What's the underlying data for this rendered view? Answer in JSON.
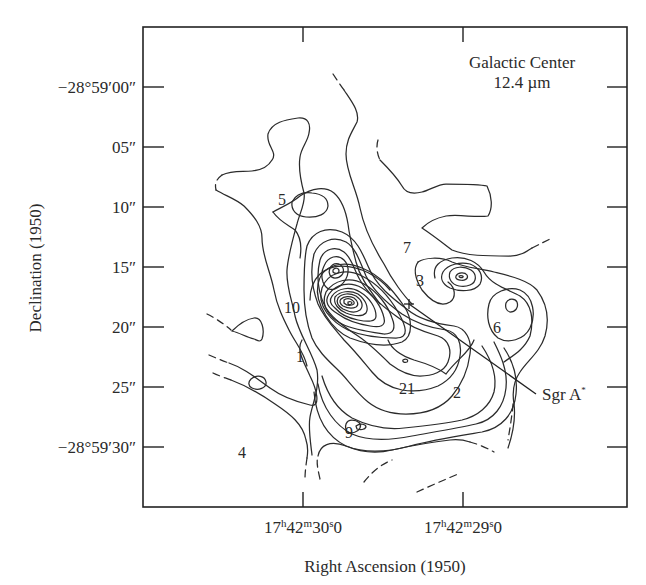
{
  "chart_data": {
    "type": "contour",
    "title": "Galactic Center",
    "subtitle": "12.4 µm",
    "xlabel": "Right Ascension (1950)",
    "ylabel": "Declination (1950)",
    "x_ticks": [
      {
        "label_parts": [
          "17",
          "h",
          "42",
          "m",
          "30",
          "s",
          ".0"
        ],
        "text": "17h42m30s.0",
        "px": 303
      },
      {
        "label_parts": [
          "17",
          "h",
          "42",
          "m",
          "29",
          "s",
          ".0"
        ],
        "text": "17h42m29s.0",
        "px": 463
      }
    ],
    "y_ticks": [
      {
        "label": "−28°59′00″",
        "value_arcsec": 0,
        "px": 87
      },
      {
        "label": "05″",
        "value_arcsec": 5,
        "px": 147
      },
      {
        "label": "10″",
        "value_arcsec": 10,
        "px": 207
      },
      {
        "label": "15″",
        "value_arcsec": 15,
        "px": 267
      },
      {
        "label": "20″",
        "value_arcsec": 20,
        "px": 327
      },
      {
        "label": "25″",
        "value_arcsec": 25,
        "px": 387
      },
      {
        "label": "−28°59′30″",
        "value_arcsec": 30,
        "px": 447
      }
    ],
    "source_labels": [
      {
        "label": "5",
        "x": 282,
        "y": 205
      },
      {
        "label": "7",
        "x": 407,
        "y": 253
      },
      {
        "label": "10",
        "x": 292,
        "y": 313
      },
      {
        "label": "3",
        "x": 420,
        "y": 286
      },
      {
        "label": "6",
        "x": 497,
        "y": 333
      },
      {
        "label": "1",
        "x": 300,
        "y": 362
      },
      {
        "label": "21",
        "x": 407,
        "y": 394
      },
      {
        "label": "2",
        "x": 457,
        "y": 398
      },
      {
        "label": "9",
        "x": 349,
        "y": 438
      },
      {
        "label": "4",
        "x": 242,
        "y": 458
      }
    ],
    "marker": {
      "label": "Sgr A*",
      "symbol": "+",
      "x": 409,
      "y": 304,
      "label_x": 542,
      "label_y": 398
    },
    "peak": {
      "x": 351,
      "y": 304,
      "contour_levels_visible": 11
    },
    "axis_ranges_px": {
      "x": [
        143,
        627
      ],
      "y": [
        27,
        507
      ]
    },
    "grid": false,
    "legend": "none"
  },
  "figure": {
    "title_line1": "Galactic Center",
    "title_line2": "12.4 µm",
    "xlabel": "Right Ascension (1950)",
    "ylabel": "Declination (1950)",
    "marker_label": "Sgr A",
    "marker_sup": "*"
  }
}
